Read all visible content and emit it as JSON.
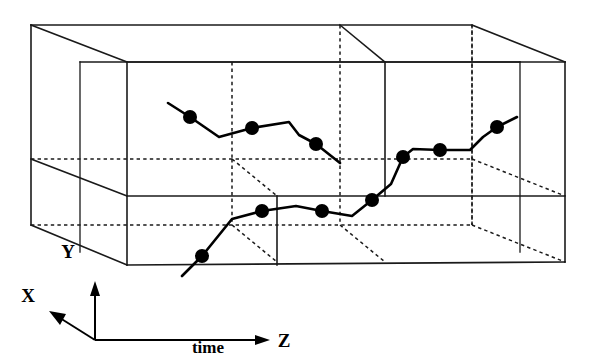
{
  "figure": {
    "background_color": "#ffffff",
    "line_color": "#1a1a1a",
    "track_color": "#000000"
  },
  "axes": {
    "x": {
      "label": "X",
      "label_x": 28,
      "label_y": 302,
      "direction": "up-left"
    },
    "y": {
      "label": "Y",
      "label_x": 68,
      "label_y": 258,
      "direction": "up"
    },
    "z": {
      "label": "Z",
      "label_x": 276,
      "label_y": 313,
      "direction": "right"
    },
    "caption": {
      "label": "time",
      "label_x": 208,
      "label_y": 340
    }
  },
  "box": {
    "description": "Rectangular volume subdivided into two layers and three cells along Z",
    "front_top_left_x": 127,
    "front_top_left_y": 62,
    "front_bottom_right_x": 565,
    "front_bottom_right_y": 262,
    "back_top_left_x": 31,
    "back_top_left_y": 25,
    "depth_offset_x": -96,
    "depth_offset_y": -37,
    "layer_divider_y": 196,
    "cell_divider_1_x": 277,
    "cell_divider_2_x": 385
  },
  "track": {
    "name": "particle-trajectory",
    "dot_radius": 7,
    "upper_segment": {
      "name": "upper-track-segment",
      "points": [
        [
          168,
          103
        ],
        [
          190,
          117
        ],
        [
          219,
          137
        ],
        [
          252,
          128
        ],
        [
          289,
          122
        ],
        [
          299,
          135
        ],
        [
          316,
          144
        ],
        [
          340,
          163
        ]
      ],
      "dots": [
        [
          190,
          117
        ],
        [
          252,
          128
        ],
        [
          316,
          144
        ]
      ]
    },
    "lower_segment": {
      "name": "lower-track-segment",
      "points": [
        [
          182,
          276
        ],
        [
          202,
          256
        ],
        [
          232,
          219
        ],
        [
          262,
          211
        ],
        [
          296,
          206
        ],
        [
          322,
          211
        ],
        [
          352,
          216
        ],
        [
          372,
          200
        ],
        [
          391,
          184
        ],
        [
          403,
          157
        ],
        [
          413,
          149
        ],
        [
          440,
          150
        ],
        [
          470,
          150
        ],
        [
          483,
          137
        ],
        [
          497,
          127
        ],
        [
          517,
          117
        ]
      ],
      "dots": [
        [
          202,
          256
        ],
        [
          262,
          211
        ],
        [
          322,
          211
        ],
        [
          372,
          200
        ],
        [
          403,
          157
        ],
        [
          440,
          150
        ],
        [
          497,
          127
        ]
      ]
    },
    "dot_count_total": 10
  }
}
